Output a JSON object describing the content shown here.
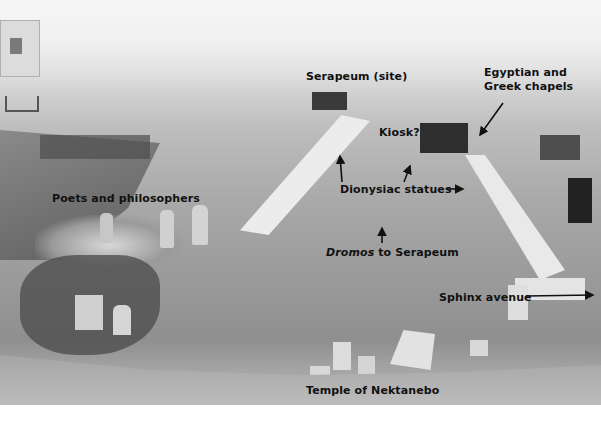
{
  "image": {
    "description": "Annotated black-and-white photograph of an excavation site with a dromos (processional way) leading to the Serapeum",
    "background_color": "#ffffff"
  },
  "labels": {
    "serapeum_site": "Serapeum (site)",
    "egyptian_greek_chapels_line1": "Egyptian and",
    "egyptian_greek_chapels_line2": "Greek chapels",
    "kiosk": "Kiosk?",
    "poets_philosophers": "Poets and philosophers",
    "dionysiac_statues": "Dionysiac statues",
    "dromos_italic": "Dromos",
    "dromos_rest": " to Serapeum",
    "sphinx_avenue": "Sphinx avenue",
    "temple_nektanebo": "Temple of Nektanebo"
  }
}
